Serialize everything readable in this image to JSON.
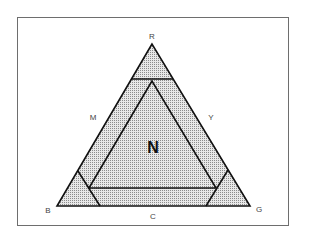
{
  "diagram": {
    "type": "color-triangle",
    "vertices": {
      "top": "R",
      "bottom_left": "B",
      "bottom_right": "G"
    },
    "edges": {
      "left": "M",
      "right": "Y",
      "bottom": "C"
    },
    "center": "N",
    "colors": {
      "stroke": "#111111",
      "fill_dots": "#9a9a9a",
      "fill_base": "#e6e6e6",
      "frame": "#6e6e6e"
    }
  }
}
